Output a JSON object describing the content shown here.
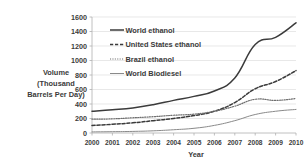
{
  "chart_data": {
    "type": "line",
    "title": "",
    "xlabel": "Year",
    "ylabel": "Volume (Thousand Barrels Per Day)",
    "ylabel_lines": [
      "Volume",
      "(Thousand",
      "Barrels Per Day)"
    ],
    "x": [
      2000,
      2001,
      2002,
      2003,
      2004,
      2005,
      2006,
      2007,
      2008,
      2009,
      2010
    ],
    "xtick_labels": [
      "2000",
      "2001",
      "2002",
      "2003",
      "2004",
      "2005",
      "2006",
      "2007",
      "2008",
      "2009",
      "2010"
    ],
    "ytick_labels": [
      "0",
      "200",
      "400",
      "600",
      "800",
      "1000",
      "1200",
      "1400",
      "1600"
    ],
    "ytick_values": [
      0,
      200,
      400,
      600,
      800,
      1000,
      1200,
      1400,
      1600
    ],
    "ylim": [
      0,
      1600
    ],
    "xlim": [
      2000,
      2010
    ],
    "grid": true,
    "legend_position": "upper-left-inside",
    "series": [
      {
        "name": "World ethanol",
        "style": "solid",
        "color": "#3b3b3b",
        "width": 1.5,
        "values": [
          300,
          320,
          345,
          390,
          450,
          505,
          580,
          760,
          1220,
          1320,
          1520
        ]
      },
      {
        "name": "United States ethanol",
        "style": "dashed",
        "color": "#3b3b3b",
        "width": 1.5,
        "values": [
          105,
          120,
          140,
          170,
          200,
          240,
          300,
          420,
          610,
          710,
          860
        ]
      },
      {
        "name": "Brazil ethanol",
        "style": "dotted",
        "color": "#6e6e6e",
        "width": 1.2,
        "values": [
          190,
          195,
          210,
          225,
          245,
          260,
          300,
          370,
          465,
          450,
          475
        ]
      },
      {
        "name": "World Biodiesel",
        "style": "solid-thin",
        "color": "#8a8a8a",
        "width": 1.0,
        "values": [
          15,
          18,
          22,
          30,
          45,
          65,
          105,
          170,
          255,
          300,
          325
        ]
      }
    ]
  },
  "legend": {
    "entries": [
      {
        "label": "World ethanol",
        "swatch": "solid-line-swatch"
      },
      {
        "label": "United States ethanol",
        "swatch": "dashed-line-swatch"
      },
      {
        "label": "Brazil ethanol",
        "swatch": "dotted-line-swatch"
      },
      {
        "label": "World Biodiesel",
        "swatch": "thin-line-swatch"
      }
    ]
  }
}
